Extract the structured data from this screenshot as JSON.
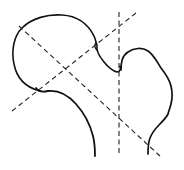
{
  "diagram": {
    "colors": {
      "background": "#ffffff",
      "stroke": "#111111"
    },
    "elements": [
      {
        "name": "femoral-head-outline",
        "style": "solid"
      },
      {
        "name": "greater-trochanter-outline",
        "style": "solid"
      },
      {
        "name": "femoral-neck-inferior-curve",
        "style": "solid"
      },
      {
        "name": "neck-axis-line",
        "style": "dashed"
      },
      {
        "name": "head-diagonal-line",
        "style": "dashed"
      },
      {
        "name": "shaft-vertical-line",
        "style": "dashed"
      }
    ]
  }
}
